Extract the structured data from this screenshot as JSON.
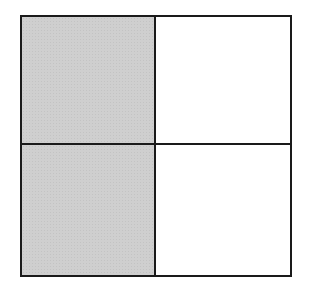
{
  "diagram": {
    "type": "fraction-grid",
    "rows": 2,
    "columns": 2,
    "total_parts": 4,
    "shaded_parts": 2,
    "colors": {
      "shaded": "#cfcfcf",
      "unshaded": "#ffffff",
      "border": "#1a1a1a"
    },
    "cells": [
      {
        "row": 0,
        "col": 0,
        "shaded": true
      },
      {
        "row": 0,
        "col": 1,
        "shaded": false
      },
      {
        "row": 1,
        "col": 0,
        "shaded": true
      },
      {
        "row": 1,
        "col": 1,
        "shaded": false
      }
    ]
  }
}
